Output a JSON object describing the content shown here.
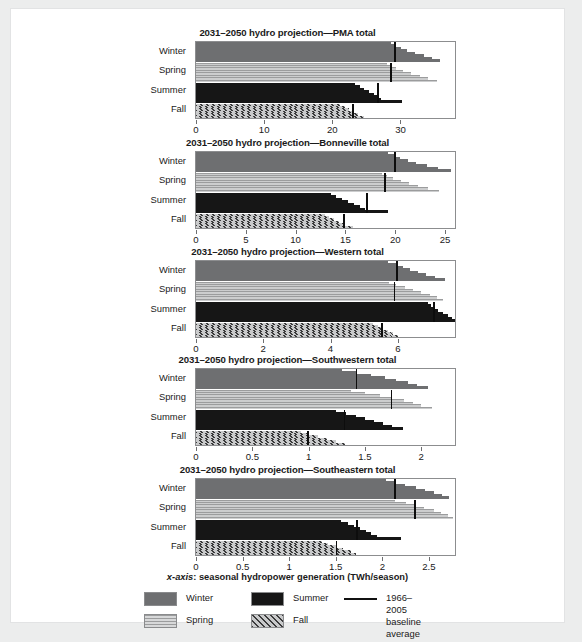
{
  "figure": {
    "axis_caption_prefix": "x-axis",
    "axis_caption_rest": ": seasonal hydropower generation (TWh/season)"
  },
  "legend": {
    "items": [
      {
        "name": "winter",
        "label": "Winter",
        "swatch": "solid-gray"
      },
      {
        "name": "spring",
        "label": "Spring",
        "swatch": "horizontal-stripes"
      },
      {
        "name": "summer",
        "label": "Summer",
        "swatch": "solid-black"
      },
      {
        "name": "fall",
        "label": "Fall",
        "swatch": "diagonal-hatch"
      },
      {
        "name": "baseline",
        "label": "1966–2005 baseline\naverage",
        "swatch": "black-line"
      }
    ]
  },
  "season_labels": [
    "Winter",
    "Spring",
    "Summer",
    "Fall"
  ],
  "chart_data": [
    {
      "type": "bar",
      "title": "2031–2050 hydro projection—PMA total",
      "xlabel": "seasonal hydropower generation (TWh/season)",
      "ylabel": "",
      "xlim": [
        0,
        38
      ],
      "ticks": [
        0,
        10,
        20,
        30
      ],
      "ticklabels": [
        "0",
        "10",
        "20",
        "30"
      ],
      "grid": false,
      "categories": [
        "Winter",
        "Spring",
        "Summer",
        "Fall"
      ],
      "baseline": {
        "Winter": 29.1,
        "Spring": 28.5,
        "Summer": 26.6,
        "Fall": 22.9
      },
      "series": [
        {
          "name": "Winter",
          "values": [
            28.6,
            29.3,
            30.1,
            31.0,
            32.2,
            33.4,
            34.6,
            35.8
          ]
        },
        {
          "name": "Spring",
          "values": [
            28.0,
            28.7,
            29.4,
            30.3,
            31.5,
            32.8,
            34.0,
            35.3
          ]
        },
        {
          "name": "Summer",
          "values": [
            23.4,
            24.0,
            24.6,
            25.4,
            26.1,
            26.6,
            27.1,
            30.2
          ]
        },
        {
          "name": "Fall",
          "values": [
            21.2,
            21.8,
            22.4,
            23.0,
            23.8,
            24.6,
            25.3,
            26.1
          ]
        }
      ]
    },
    {
      "type": "bar",
      "title": "2031–2050 hydro projection—Bonneville total",
      "xlabel": "seasonal hydropower generation (TWh/season)",
      "ylabel": "",
      "xlim": [
        0,
        26
      ],
      "ticks": [
        0,
        5,
        10,
        15,
        20,
        25
      ],
      "ticklabels": [
        "0",
        "5",
        "10",
        "15",
        "20",
        "25"
      ],
      "grid": false,
      "categories": [
        "Winter",
        "Spring",
        "Summer",
        "Fall"
      ],
      "baseline": {
        "Winter": 19.9,
        "Spring": 18.9,
        "Summer": 17.1,
        "Fall": 14.8
      },
      "series": [
        {
          "name": "Winter",
          "values": [
            19.3,
            19.9,
            20.5,
            21.3,
            22.1,
            23.2,
            24.3,
            25.6
          ]
        },
        {
          "name": "Spring",
          "values": [
            18.7,
            19.2,
            19.8,
            20.6,
            21.4,
            22.3,
            23.3,
            24.4
          ]
        },
        {
          "name": "Summer",
          "values": [
            13.6,
            14.1,
            14.7,
            15.3,
            15.9,
            16.5,
            17.0,
            19.3
          ]
        },
        {
          "name": "Fall",
          "values": [
            12.9,
            13.4,
            13.9,
            14.4,
            15.0,
            15.8,
            16.6,
            17.2
          ]
        }
      ]
    },
    {
      "type": "bar",
      "title": "2031–2050 hydro projection—Western total",
      "xlabel": "seasonal hydropower generation (TWh/season)",
      "ylabel": "",
      "xlim": [
        0,
        7.7
      ],
      "ticks": [
        0,
        2,
        4,
        6
      ],
      "ticklabels": [
        "0",
        "2",
        "4",
        "6"
      ],
      "grid": false,
      "categories": [
        "Winter",
        "Spring",
        "Summer",
        "Fall"
      ],
      "baseline": {
        "Winter": 5.95,
        "Spring": 5.88,
        "Summer": 7.05,
        "Fall": 5.5
      },
      "series": [
        {
          "name": "Winter",
          "values": [
            5.7,
            5.95,
            6.15,
            6.35,
            6.6,
            6.85,
            7.1,
            7.4
          ]
        },
        {
          "name": "Spring",
          "values": [
            5.75,
            5.95,
            6.2,
            6.45,
            6.7,
            6.95,
            7.15,
            7.35
          ]
        },
        {
          "name": "Summer",
          "values": [
            6.9,
            7.0,
            7.1,
            7.2,
            7.35,
            7.5,
            7.6,
            7.7
          ]
        },
        {
          "name": "Fall",
          "values": [
            5.25,
            5.4,
            5.55,
            5.7,
            5.85,
            6.0,
            6.1,
            6.2
          ]
        }
      ]
    },
    {
      "type": "bar",
      "title": "2031–2050 hydro projection—Southwestern total",
      "xlabel": "seasonal hydropower generation (TWh/season)",
      "ylabel": "",
      "xlim": [
        0,
        2.3
      ],
      "ticks": [
        0,
        0.5,
        1,
        1.5,
        2
      ],
      "ticklabels": [
        "0",
        "0.5",
        "1",
        "1.5",
        "2"
      ],
      "grid": false,
      "categories": [
        "Winter",
        "Spring",
        "Summer",
        "Fall"
      ],
      "baseline": {
        "Winter": 1.42,
        "Spring": 1.73,
        "Summer": 1.31,
        "Fall": 0.99
      },
      "series": [
        {
          "name": "Winter",
          "values": [
            1.3,
            1.42,
            1.55,
            1.68,
            1.78,
            1.88,
            1.96,
            2.06
          ]
        },
        {
          "name": "Spring",
          "values": [
            1.38,
            1.5,
            1.63,
            1.74,
            1.85,
            1.93,
            2.0,
            2.1
          ]
        },
        {
          "name": "Summer",
          "values": [
            1.24,
            1.33,
            1.42,
            1.5,
            1.58,
            1.66,
            1.74,
            1.84
          ]
        },
        {
          "name": "Fall",
          "values": [
            0.93,
            1.0,
            1.08,
            1.16,
            1.24,
            1.32,
            1.38,
            1.45
          ]
        }
      ]
    },
    {
      "type": "bar",
      "title": "2031–2050 hydro projection—Southeastern total",
      "xlabel": "seasonal hydropower generation (TWh/season)",
      "ylabel": "",
      "xlim": [
        0,
        2.78
      ],
      "ticks": [
        0,
        0.5,
        1,
        1.5,
        2,
        2.5
      ],
      "ticklabels": [
        "0",
        "0.5",
        "1",
        "1.5",
        "2",
        "2.5"
      ],
      "grid": false,
      "categories": [
        "Winter",
        "Spring",
        "Summer",
        "Fall"
      ],
      "baseline": {
        "Winter": 2.13,
        "Spring": 2.34,
        "Summer": 1.72,
        "Fall": 1.5
      },
      "series": [
        {
          "name": "Winter",
          "values": [
            2.04,
            2.13,
            2.24,
            2.36,
            2.46,
            2.55,
            2.64,
            2.72
          ]
        },
        {
          "name": "Spring",
          "values": [
            2.14,
            2.25,
            2.35,
            2.45,
            2.55,
            2.63,
            2.7,
            2.76
          ]
        },
        {
          "name": "Summer",
          "values": [
            1.56,
            1.63,
            1.7,
            1.76,
            1.82,
            1.88,
            1.94,
            2.2
          ]
        },
        {
          "name": "Fall",
          "values": [
            1.35,
            1.42,
            1.5,
            1.58,
            1.66,
            1.72,
            1.78,
            1.84
          ]
        }
      ]
    }
  ]
}
